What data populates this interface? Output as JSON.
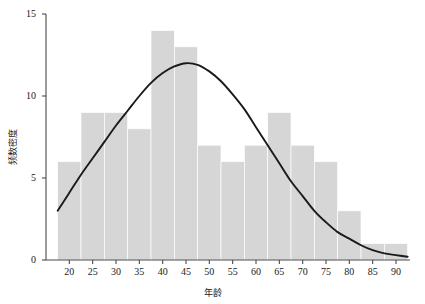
{
  "chart_data": {
    "type": "bar",
    "title": "",
    "subtitle": "",
    "xlabel": "年龄",
    "ylabel": "频数密度",
    "xlim": [
      15,
      93
    ],
    "ylim": [
      0,
      15
    ],
    "xticks": [
      20,
      25,
      30,
      35,
      40,
      45,
      50,
      55,
      60,
      65,
      70,
      75,
      80,
      85,
      90
    ],
    "yticks": [
      0,
      5,
      10,
      15
    ],
    "grid": false,
    "legend": null,
    "bin_width": 5,
    "bar_color": "#d6d6d6",
    "curve_color": "#1a1a1a",
    "bins": [
      {
        "x0": 17.5,
        "x1": 22.5,
        "value": 6
      },
      {
        "x0": 22.5,
        "x1": 27.5,
        "value": 9
      },
      {
        "x0": 27.5,
        "x1": 32.5,
        "value": 9
      },
      {
        "x0": 32.5,
        "x1": 37.5,
        "value": 8
      },
      {
        "x0": 37.5,
        "x1": 42.5,
        "value": 14
      },
      {
        "x0": 42.5,
        "x1": 47.5,
        "value": 13
      },
      {
        "x0": 47.5,
        "x1": 52.5,
        "value": 7
      },
      {
        "x0": 52.5,
        "x1": 57.5,
        "value": 6
      },
      {
        "x0": 57.5,
        "x1": 62.5,
        "value": 7
      },
      {
        "x0": 62.5,
        "x1": 67.5,
        "value": 9
      },
      {
        "x0": 67.5,
        "x1": 72.5,
        "value": 7
      },
      {
        "x0": 72.5,
        "x1": 77.5,
        "value": 6
      },
      {
        "x0": 77.5,
        "x1": 82.5,
        "value": 3
      },
      {
        "x0": 82.5,
        "x1": 87.5,
        "value": 1
      },
      {
        "x0": 87.5,
        "x1": 92.5,
        "value": 1
      }
    ],
    "categories": [
      "17.5-22.5",
      "22.5-27.5",
      "27.5-32.5",
      "32.5-37.5",
      "37.5-42.5",
      "42.5-47.5",
      "47.5-52.5",
      "52.5-57.5",
      "57.5-62.5",
      "62.5-67.5",
      "67.5-72.5",
      "72.5-77.5",
      "77.5-82.5",
      "82.5-87.5",
      "87.5-92.5"
    ],
    "values": [
      6,
      9,
      9,
      8,
      14,
      13,
      7,
      6,
      7,
      9,
      7,
      6,
      3,
      1,
      1
    ],
    "overlay_curve": {
      "name": "density-curve",
      "type": "line",
      "peak_x": 45,
      "peak_y": 12,
      "points": [
        {
          "x": 17.5,
          "y": 3.0
        },
        {
          "x": 20,
          "y": 4.1
        },
        {
          "x": 22.5,
          "y": 5.2
        },
        {
          "x": 25,
          "y": 6.2
        },
        {
          "x": 27.5,
          "y": 7.2
        },
        {
          "x": 30,
          "y": 8.2
        },
        {
          "x": 32.5,
          "y": 9.1
        },
        {
          "x": 35,
          "y": 10.0
        },
        {
          "x": 37.5,
          "y": 10.8
        },
        {
          "x": 40,
          "y": 11.4
        },
        {
          "x": 42.5,
          "y": 11.8
        },
        {
          "x": 45,
          "y": 12.0
        },
        {
          "x": 47.5,
          "y": 11.9
        },
        {
          "x": 50,
          "y": 11.5
        },
        {
          "x": 52.5,
          "y": 10.9
        },
        {
          "x": 55,
          "y": 10.1
        },
        {
          "x": 57.5,
          "y": 9.2
        },
        {
          "x": 60,
          "y": 8.1
        },
        {
          "x": 62.5,
          "y": 7.0
        },
        {
          "x": 65,
          "y": 5.9
        },
        {
          "x": 67.5,
          "y": 4.8
        },
        {
          "x": 70,
          "y": 3.9
        },
        {
          "x": 72.5,
          "y": 3.0
        },
        {
          "x": 75,
          "y": 2.3
        },
        {
          "x": 77.5,
          "y": 1.7
        },
        {
          "x": 80,
          "y": 1.3
        },
        {
          "x": 82.5,
          "y": 0.9
        },
        {
          "x": 85,
          "y": 0.6
        },
        {
          "x": 87.5,
          "y": 0.4
        },
        {
          "x": 90,
          "y": 0.3
        },
        {
          "x": 92.5,
          "y": 0.2
        }
      ]
    }
  }
}
